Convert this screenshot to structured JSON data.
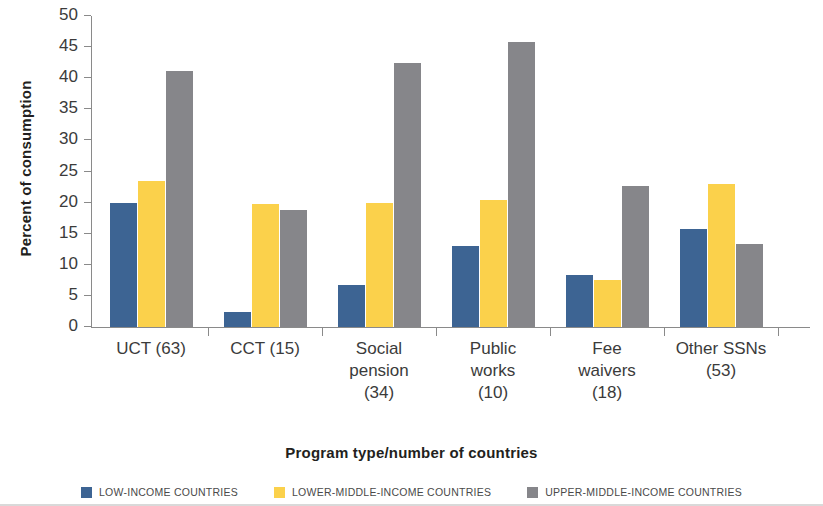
{
  "chart_data": {
    "type": "bar",
    "title": "",
    "xlabel": "Program type/number of countries",
    "ylabel": "Percent of consumption",
    "categories": [
      "UCT (63)",
      "CCT (15)",
      "Social pension (34)",
      "Public works (10)",
      "Fee waivers (18)",
      "Other SSNs (53)"
    ],
    "category_lines": [
      [
        "UCT (63)"
      ],
      [
        "CCT (15)"
      ],
      [
        "Social",
        "pension",
        "(34)"
      ],
      [
        "Public",
        "works",
        "(10)"
      ],
      [
        "Fee",
        "waivers",
        "(18)"
      ],
      [
        "Other SSNs",
        "(53)"
      ]
    ],
    "series": [
      {
        "name": "LOW-INCOME COUNTRIES",
        "color": "#3d6493",
        "values": [
          20.0,
          2.4,
          6.7,
          13.0,
          8.4,
          15.7
        ]
      },
      {
        "name": "LOWER-MIDDLE-INCOME COUNTRIES",
        "color": "#fbd14b",
        "values": [
          23.4,
          19.7,
          19.9,
          20.5,
          7.6,
          23.0
        ]
      },
      {
        "name": "UPPER-MIDDLE-INCOME COUNTRIES",
        "color": "#86868a",
        "values": [
          41.2,
          18.8,
          42.4,
          45.8,
          22.7,
          13.3
        ]
      }
    ],
    "ylim": [
      0,
      50
    ],
    "yticks": [
      0,
      5,
      10,
      15,
      20,
      25,
      30,
      35,
      40,
      45,
      50
    ],
    "ytick_labels": [
      "0",
      "5",
      "10",
      "15",
      "20",
      "25",
      "30",
      "35",
      "40",
      "45",
      "50"
    ],
    "grid": false,
    "legend_position": "bottom"
  },
  "legend": {
    "items": [
      {
        "label": "LOW-INCOME COUNTRIES",
        "color": "#3d6493"
      },
      {
        "label": "LOWER-MIDDLE-INCOME COUNTRIES",
        "color": "#fbd14b"
      },
      {
        "label": "UPPER-MIDDLE-INCOME COUNTRIES",
        "color": "#86868a"
      }
    ]
  }
}
